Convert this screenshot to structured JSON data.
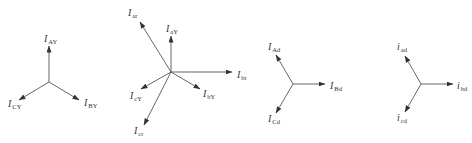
{
  "diagram": {
    "type": "phasor-diagrams",
    "line_color": "#555555",
    "text_color": "#333333",
    "panels": [
      {
        "id": "star-currents",
        "center": [
          49,
          82
        ],
        "vectors": [
          {
            "label_main": "I",
            "label_sub": "AY",
            "tip": [
              49,
              46
            ],
            "label_pos": [
              44,
              42
            ]
          },
          {
            "label_main": "I",
            "label_sub": "BY",
            "tip": [
              79,
              100
            ],
            "label_pos": [
              84,
              106
            ]
          },
          {
            "label_main": "I",
            "label_sub": "CY",
            "tip": [
              19,
              100
            ],
            "label_pos": [
              8,
              107
            ]
          }
        ]
      },
      {
        "id": "combined",
        "center": [
          171,
          72
        ],
        "vectors": [
          {
            "label_main": "I",
            "label_sub": "ar",
            "tip": [
              140,
              22
            ],
            "label_pos": [
              128,
              16
            ]
          },
          {
            "label_main": "I",
            "label_sub": "aY",
            "tip": [
              171,
              36
            ],
            "label_pos": [
              166,
              32
            ]
          },
          {
            "label_main": "I",
            "label_sub": "br",
            "tip": [
              232,
              72
            ],
            "label_pos": [
              237,
              78
            ]
          },
          {
            "label_main": "I",
            "label_sub": "bY",
            "tip": [
              200,
              89
            ],
            "label_pos": [
              203,
              97
            ]
          },
          {
            "label_main": "I",
            "label_sub": "cY",
            "tip": [
              141,
              89
            ],
            "label_pos": [
              130,
              99
            ]
          },
          {
            "label_main": "I",
            "label_sub": "cr",
            "tip": [
              144,
              125
            ],
            "label_pos": [
              134,
              134
            ]
          }
        ]
      },
      {
        "id": "delta-currents",
        "center": [
          293,
          84
        ],
        "vectors": [
          {
            "label_main": "I",
            "label_sub": "Ad",
            "tip": [
              276,
              55
            ],
            "label_pos": [
              268,
              50
            ]
          },
          {
            "label_main": "I",
            "label_sub": "Bd",
            "tip": [
              325,
              84
            ],
            "label_pos": [
              330,
              89
            ]
          },
          {
            "label_main": "I",
            "label_sub": "Cd",
            "tip": [
              276,
              113
            ],
            "label_pos": [
              268,
              122
            ]
          }
        ]
      },
      {
        "id": "delta-line-currents",
        "center": [
          421,
          84
        ],
        "vectors": [
          {
            "label_main": "i",
            "label_sub": "ad",
            "tip": [
              405,
              56
            ],
            "label_pos": [
              397,
              50
            ]
          },
          {
            "label_main": "i",
            "label_sub": "bd",
            "tip": [
              453,
              84
            ],
            "label_pos": [
              457,
              89
            ]
          },
          {
            "label_main": "i",
            "label_sub": "cd",
            "tip": [
              405,
              112
            ],
            "label_pos": [
              397,
              121
            ]
          }
        ]
      }
    ]
  }
}
